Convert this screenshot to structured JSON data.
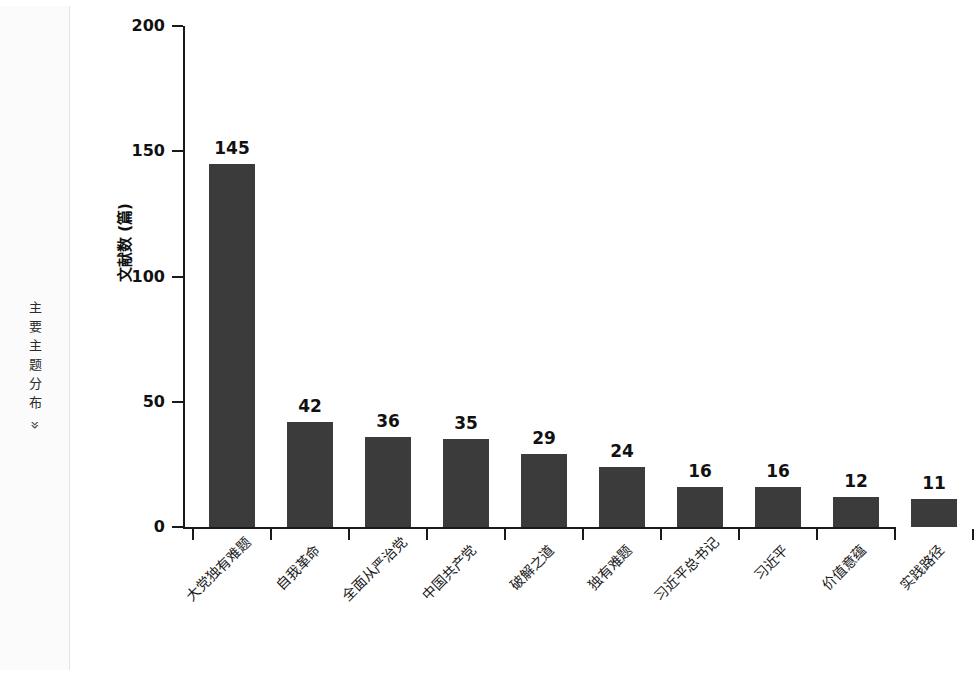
{
  "sidebar": {
    "label": "主要主题分布",
    "chevron": "»"
  },
  "chart_data": {
    "type": "bar",
    "title": "",
    "xlabel": "",
    "ylabel": "文献数 (篇)",
    "ylim": [
      0,
      200
    ],
    "yticks": [
      0,
      50,
      100,
      150,
      200
    ],
    "grid": false,
    "legend": null,
    "bar_color": "#3b3b3b",
    "categories": [
      "大党独有难题",
      "自我革命",
      "全面从严治党",
      "中国共产党",
      "破解之道",
      "独有难题",
      "习近平总书记",
      "习近平",
      "价值意蕴",
      "实践路径"
    ],
    "values": [
      145,
      42,
      36,
      35,
      29,
      24,
      16,
      16,
      12,
      11
    ],
    "value_labels": [
      "145",
      "42",
      "36",
      "35",
      "29",
      "24",
      "16",
      "16",
      "12",
      "11"
    ]
  }
}
